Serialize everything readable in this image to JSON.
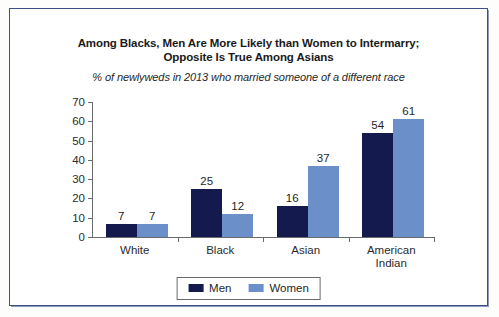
{
  "chart_data": {
    "type": "bar",
    "title": "Among Blacks, Men Are More Likely than Women to Intermarry; Opposite Is True Among Asians",
    "title_line1": "Among Blacks, Men Are More Likely than Women to Intermarry;",
    "title_line2": "Opposite Is True Among Asians",
    "subtitle": "% of newlyweds in 2013 who married someone of a different race",
    "categories": [
      "White",
      "Black",
      "Asian",
      "American Indian"
    ],
    "series": [
      {
        "name": "Men",
        "values": [
          7,
          25,
          16,
          54
        ],
        "color": "#141a4e"
      },
      {
        "name": "Women",
        "values": [
          7,
          12,
          37,
          61
        ],
        "color": "#6b8fc9"
      }
    ],
    "xlabel": "",
    "ylabel": "",
    "ylim": [
      0,
      70
    ],
    "yticks": [
      0,
      10,
      20,
      30,
      40,
      50,
      60,
      70
    ],
    "grid": false,
    "legend_position": "bottom",
    "value_labels": true
  },
  "frame": {
    "border_color": "#3f4f86"
  }
}
